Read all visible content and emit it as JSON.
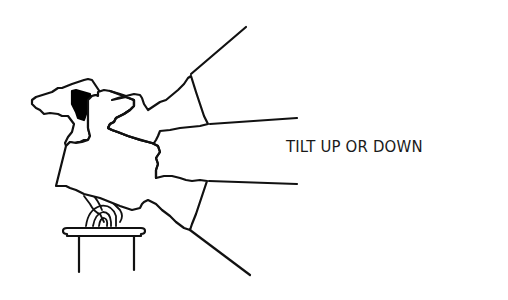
{
  "caption": {
    "text": "TILT UP OR DOWN"
  },
  "illustration": {
    "subject": "spotlight-fixture-on-pedestal",
    "beam_lines": 4,
    "stroke_color": "#111111",
    "fill_color": "#ffffff",
    "accent_fill": "#000000"
  }
}
